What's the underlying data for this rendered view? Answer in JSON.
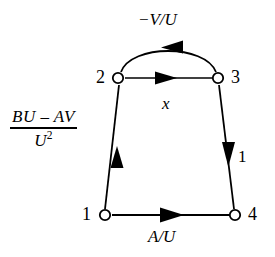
{
  "figure": {
    "background_color": "#ffffff",
    "stroke_color": "#000000"
  },
  "nodes": [
    {
      "id": "1",
      "label": "1",
      "x": 105,
      "y": 215,
      "marker": "hollow-circle",
      "label_side": "left"
    },
    {
      "id": "2",
      "label": "2",
      "x": 118,
      "y": 78,
      "marker": "hollow-circle",
      "label_side": "left"
    },
    {
      "id": "3",
      "label": "3",
      "x": 218,
      "y": 78,
      "marker": "hollow-circle",
      "label_side": "right"
    },
    {
      "id": "4",
      "label": "4",
      "x": 235,
      "y": 215,
      "marker": "hollow-circle",
      "label_side": "right"
    }
  ],
  "edges": [
    {
      "id": "edge-1-2",
      "from": "1",
      "to": "2",
      "shape": "straight",
      "arrow": "up",
      "label": "(BU - AV)/U^2"
    },
    {
      "id": "edge-2-3",
      "from": "2",
      "to": "3",
      "shape": "straight",
      "arrow": "right",
      "label": "x"
    },
    {
      "id": "edge-3-2",
      "from": "3",
      "to": "2",
      "shape": "arc",
      "arrow": "left",
      "label": "-V/U"
    },
    {
      "id": "edge-3-4",
      "from": "3",
      "to": "4",
      "shape": "straight",
      "arrow": "down",
      "label": "1"
    },
    {
      "id": "edge-1-4",
      "from": "1",
      "to": "4",
      "shape": "straight",
      "arrow": "right",
      "label": "A/U"
    }
  ],
  "labels": {
    "arc_gain": "−V/U",
    "straight_top_gain": "x",
    "bottom_gain": "A/U",
    "right_gain": "1",
    "left_fraction_numerator": "BU – AV",
    "left_fraction_denominator": "U",
    "left_fraction_denominator_exponent": "2"
  }
}
